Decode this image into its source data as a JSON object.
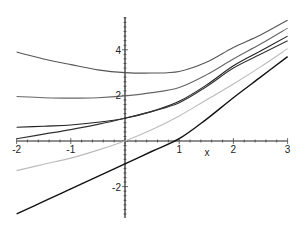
{
  "chart_data": {
    "type": "line",
    "title": "",
    "xlabel": "x",
    "ylabel": "",
    "xlim": [
      -2,
      3
    ],
    "ylim": [
      -3.3,
      5.3
    ],
    "grid": false,
    "legend": "none",
    "x_ticks": [
      "-2",
      "-1",
      "1",
      "2",
      "3"
    ],
    "y_ticks": [
      "4",
      "2",
      "-2"
    ],
    "x": [
      -2,
      -1.5,
      -1,
      -0.5,
      0,
      0.5,
      1,
      1.5,
      2,
      2.5,
      3
    ],
    "series": [
      {
        "name": "curve-1",
        "color": "#555555",
        "values": [
          3.9,
          3.6,
          3.35,
          3.12,
          3.0,
          2.98,
          3.05,
          3.45,
          4.1,
          4.65,
          5.3
        ]
      },
      {
        "name": "curve-2",
        "color": "#666666",
        "values": [
          1.95,
          1.9,
          1.88,
          1.9,
          1.98,
          2.12,
          2.35,
          2.9,
          3.6,
          4.25,
          4.95
        ]
      },
      {
        "name": "curve-3",
        "color": "#222222",
        "values": [
          0.6,
          0.65,
          0.7,
          0.82,
          1.0,
          1.3,
          1.74,
          2.45,
          3.3,
          3.95,
          4.6
        ]
      },
      {
        "name": "curve-4",
        "color": "#333333",
        "values": [
          0.1,
          0.3,
          0.5,
          0.73,
          1.0,
          1.3,
          1.68,
          2.38,
          3.2,
          3.8,
          4.4
        ]
      },
      {
        "name": "curve-5",
        "color": "#bbbbbb",
        "values": [
          -1.3,
          -1.02,
          -0.75,
          -0.4,
          0.0,
          0.5,
          1.1,
          1.8,
          2.5,
          3.25,
          4.05
        ]
      },
      {
        "name": "curve-6",
        "color": "#111111",
        "values": [
          -3.2,
          -2.65,
          -2.1,
          -1.55,
          -1.0,
          -0.45,
          0.1,
          0.95,
          1.9,
          2.8,
          3.7
        ]
      }
    ]
  }
}
